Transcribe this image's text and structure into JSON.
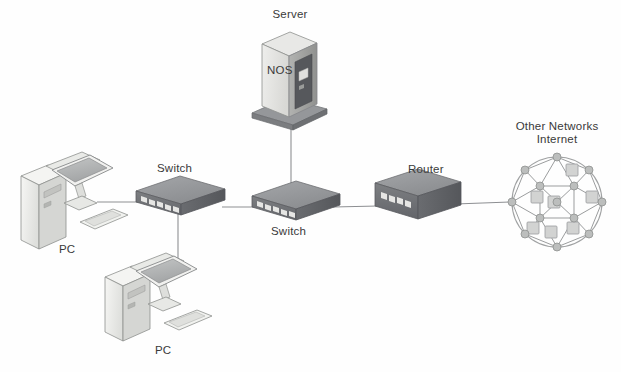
{
  "diagram": {
    "background_color": "#fefefe",
    "line_color": "#8d8f92",
    "labels": {
      "server": "Server",
      "server_os": "NOS",
      "switch_top": "Switch",
      "switch_bottom": "Switch",
      "router": "Router",
      "cloud_line1": "Other Networks",
      "cloud_line2": "Internet",
      "pc_left": "PC",
      "pc_bottom": "PC"
    },
    "nodes": [
      {
        "id": "pc-left",
        "type": "workstation",
        "label": "PC",
        "x": 60,
        "y": 205
      },
      {
        "id": "pc-bottom",
        "type": "workstation",
        "label": "PC",
        "x": 165,
        "y": 305
      },
      {
        "id": "switch-left",
        "type": "switch",
        "label": "Switch",
        "x": 178,
        "y": 200
      },
      {
        "id": "switch-right",
        "type": "switch",
        "label": "Switch",
        "x": 293,
        "y": 205
      },
      {
        "id": "server",
        "type": "server-tower",
        "label": "Server",
        "x": 288,
        "y": 70
      },
      {
        "id": "router",
        "type": "router",
        "label": "Router",
        "x": 417,
        "y": 200
      },
      {
        "id": "cloud",
        "type": "mesh-network",
        "label": "Other Networks",
        "x": 557,
        "y": 200
      }
    ],
    "links": [
      {
        "from": "pc-left",
        "to": "switch-left"
      },
      {
        "from": "switch-left",
        "to": "pc-bottom"
      },
      {
        "from": "switch-left",
        "to": "switch-right"
      },
      {
        "from": "server",
        "to": "switch-right"
      },
      {
        "from": "switch-right",
        "to": "router"
      },
      {
        "from": "router",
        "to": "cloud"
      }
    ],
    "colors": {
      "device_top": "#9a9c9f",
      "device_front": "#6f7174",
      "device_side": "#5d5f62",
      "server_front": "#e3e3e1",
      "server_side": "#a9aaa8",
      "pc_light": "#f2f2f0",
      "pc_screen": "#b4b6b6",
      "outline": "#7c7e80",
      "mesh_node": "#b8bab9",
      "mesh_box": "#cdcecd"
    }
  }
}
